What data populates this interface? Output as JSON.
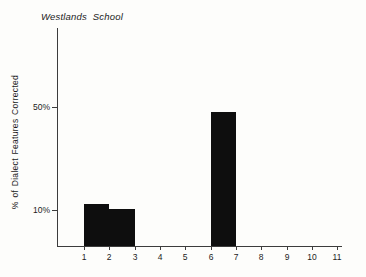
{
  "title": "Westlands School",
  "y_axis": {
    "label": "% of Dialect Features Corrected"
  },
  "chart_data": {
    "type": "bar",
    "title": "Westlands School",
    "xlabel": "",
    "ylabel": "% of Dialect Features Corrected",
    "x_tick_labels": [
      "1",
      "2",
      "3",
      "4",
      "5",
      "6",
      "7",
      "8",
      "9",
      "10",
      "11"
    ],
    "y_ticks": [
      {
        "label": "50%",
        "value": 50
      },
      {
        "label": "10%",
        "value": 10
      }
    ],
    "xlim": [
      0,
      11.2
    ],
    "ylim": [
      0,
      80
    ],
    "grid": false,
    "legend": false,
    "bar_color": "#0e0e0e",
    "bars": [
      {
        "x_from": 1,
        "x_to": 2,
        "value": 12.5
      },
      {
        "x_from": 2,
        "x_to": 3,
        "value": 10.5
      },
      {
        "x_from": 6,
        "x_to": 7,
        "value": 48
      }
    ]
  }
}
